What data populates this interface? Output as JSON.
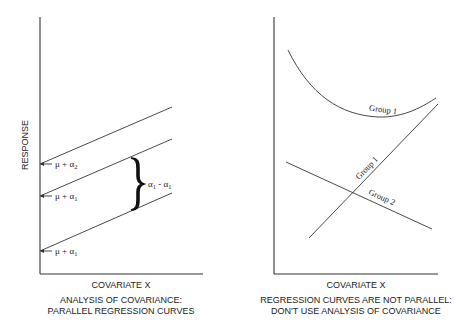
{
  "left_panel": {
    "y_axis_label": "RESPONSE",
    "x_axis_label": "COVARIATE X",
    "caption_line1": "ANALYSIS OF COVARIANCE:",
    "caption_line2": "PARALLEL REGRESSION CURVES",
    "intercepts": [
      {
        "label": "μ + α",
        "sub": "2"
      },
      {
        "label": "μ + α",
        "sub": "1"
      },
      {
        "label": "μ + α",
        "sub": "1"
      }
    ],
    "bracket_label": {
      "a": "α",
      "a_sub": "1",
      "sep": " - ",
      "b": "α",
      "b_sub": "1"
    }
  },
  "right_panel": {
    "x_axis_label": "COVARIATE X",
    "caption_line1": "REGRESSION CURVES ARE NOT PARALLEL:",
    "caption_line2": "DON'T USE ANALYSIS OF COVARIANCE",
    "curve_labels": {
      "group1_curve": "Group 1",
      "group1_line": "Group 1",
      "group2_line": "Group 2"
    }
  }
}
